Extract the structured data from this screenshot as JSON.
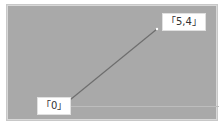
{
  "canvas": {
    "background": "#a9a9a9",
    "line_color": "#6e6e6e"
  },
  "points": {
    "start": {
      "label": "「0」",
      "x": 65,
      "y": 104
    },
    "end": {
      "label": "「5,4」",
      "x": 157,
      "y": 29
    }
  }
}
